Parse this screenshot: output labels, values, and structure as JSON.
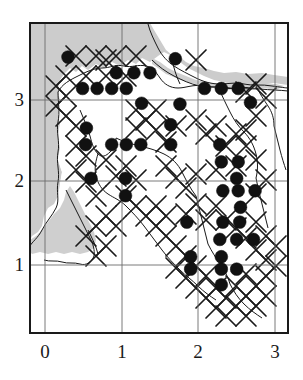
{
  "figure": {
    "title": "",
    "type": "distribution-map",
    "colors": {
      "frame": "#1a1a1a",
      "grid": "#555555",
      "dot": "#111111",
      "hatch": "#1a1a1a",
      "shading": "#c9c9c9",
      "coastline": "#1a1a1a",
      "background": "#ffffff"
    }
  },
  "chart_data": {
    "type": "scatter",
    "title": "",
    "xlabel": "",
    "ylabel": "",
    "xlim": [
      -0.22,
      3.18
    ],
    "ylim": [
      0.12,
      3.72
    ],
    "xticks": [
      0,
      1,
      2,
      3
    ],
    "yticks": [
      1,
      2,
      3
    ],
    "xtick_labels": [
      "0",
      "1",
      "2",
      "3"
    ],
    "ytick_labels": [
      "1",
      "2",
      "3"
    ],
    "grid": true,
    "legend": null,
    "series": [
      {
        "name": "occurrence-records",
        "marker": "filled-circle",
        "count": 57,
        "points": [
          [
            0.3,
            3.52
          ],
          [
            0.49,
            3.14
          ],
          [
            0.68,
            3.14
          ],
          [
            0.87,
            3.14
          ],
          [
            1.06,
            3.14
          ],
          [
            0.93,
            3.33
          ],
          [
            1.16,
            3.33
          ],
          [
            1.37,
            3.33
          ],
          [
            1.7,
            3.5
          ],
          [
            2.08,
            3.14
          ],
          [
            2.3,
            3.14
          ],
          [
            2.52,
            3.14
          ],
          [
            2.68,
            2.97
          ],
          [
            1.26,
            2.96
          ],
          [
            1.76,
            2.95
          ],
          [
            0.54,
            2.66
          ],
          [
            1.64,
            2.7
          ],
          [
            0.53,
            2.46
          ],
          [
            0.87,
            2.46
          ],
          [
            1.06,
            2.46
          ],
          [
            1.25,
            2.46
          ],
          [
            1.64,
            2.46
          ],
          [
            2.28,
            2.46
          ],
          [
            2.3,
            2.25
          ],
          [
            2.52,
            2.25
          ],
          [
            2.5,
            2.05
          ],
          [
            0.6,
            2.05
          ],
          [
            1.05,
            2.05
          ],
          [
            1.05,
            1.84
          ],
          [
            2.32,
            1.9
          ],
          [
            2.52,
            1.9
          ],
          [
            2.74,
            1.9
          ],
          [
            2.55,
            1.7
          ],
          [
            2.32,
            1.52
          ],
          [
            2.54,
            1.52
          ],
          [
            1.85,
            1.52
          ],
          [
            2.28,
            1.31
          ],
          [
            2.5,
            1.31
          ],
          [
            2.72,
            1.31
          ],
          [
            1.9,
            1.1
          ],
          [
            2.3,
            1.1
          ],
          [
            1.9,
            0.95
          ],
          [
            2.3,
            0.95
          ],
          [
            2.5,
            0.95
          ],
          [
            2.3,
            0.76
          ]
        ]
      }
    ],
    "annotations": {
      "hatched_squares": "X-cross hatch marks indicating surveyed but unoccupied 10-km squares",
      "shaded_region": "Grey tone marks sea / out-of-region area",
      "outline": "Coastline and county boundary"
    }
  },
  "axes": {
    "x_labels": [
      {
        "text": "0",
        "value": 0
      },
      {
        "text": "1",
        "value": 1
      },
      {
        "text": "2",
        "value": 2
      },
      {
        "text": "3",
        "value": 3
      }
    ],
    "y_labels": [
      {
        "text": "3",
        "value": 3
      },
      {
        "text": "2",
        "value": 2
      },
      {
        "text": "1",
        "value": 1
      }
    ]
  }
}
